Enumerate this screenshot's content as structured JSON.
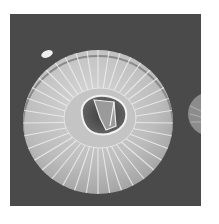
{
  "image": {
    "kind": "grayscale scanning electron micrograph",
    "subject": "radially ribbed disc-shaped microstructure (coccolith-like plate) with central opening",
    "background_color": "#4a4a4a",
    "page_color": "#ffffff",
    "subject_color": "#bcbcbc",
    "highlight_color": "#f0f0f0",
    "rib_count": 40
  }
}
